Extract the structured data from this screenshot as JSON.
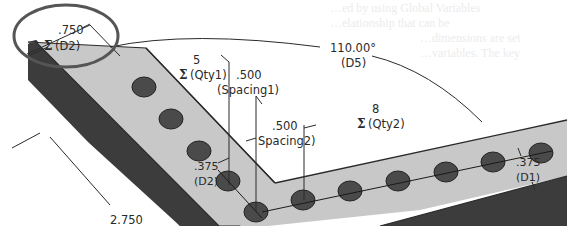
{
  "figure": {
    "colors": {
      "top_face": "#c8c8c8",
      "side_face": "#3c3c3c",
      "hole_fill": "#4a4a4a",
      "line": "#2a2a2a",
      "highlight_circle": "#555555",
      "bleed_text": "#ececec"
    },
    "bleed_through_text": [
      "…ed by using Global Variables",
      "…elationship that can be",
      "…dimensions are set",
      "…variables. The key"
    ],
    "dimensions": {
      "d2_width": {
        "value": ".750",
        "sigma": "Σ",
        "name": "(D2)"
      },
      "qty1": {
        "value": "5",
        "sigma": "Σ",
        "name": "(Qty1)"
      },
      "spacing1": {
        "value": ".500",
        "name": "(Spacing1)"
      },
      "spacing2": {
        "value": ".500",
        "name": "Spacing2)"
      },
      "angle_d5": {
        "value": "110.00°",
        "name": "(D5)"
      },
      "qty2": {
        "value": "8",
        "sigma": "Σ",
        "name": "(Qty2)"
      },
      "hole_d2": {
        "value": ".375",
        "name": "(D2)"
      },
      "hole_d1": {
        "value": ".375",
        "name": "(D1)"
      },
      "length": {
        "value": "2.750"
      }
    },
    "patterns": {
      "leg1_holes": 5,
      "leg2_holes": 8
    }
  }
}
